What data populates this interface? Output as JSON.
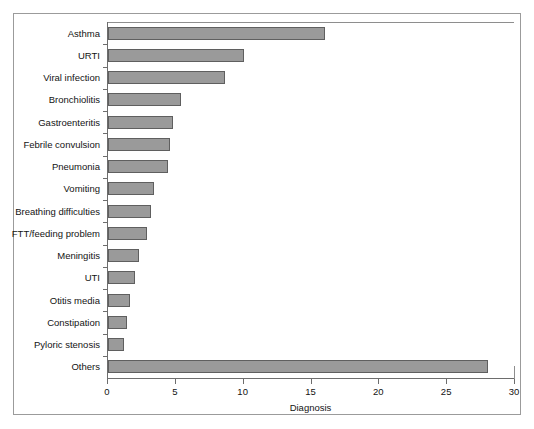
{
  "chart_data": {
    "type": "bar",
    "orientation": "horizontal",
    "title": "",
    "xlabel": "Diagnosis",
    "ylabel": "",
    "xlim": [
      0,
      30
    ],
    "xticks": [
      0,
      5,
      10,
      15,
      20,
      25,
      30
    ],
    "grid": false,
    "legend": null,
    "bar_color": "#9a9a9a",
    "bar_edge_color": "#5f5f5f",
    "categories": [
      "Asthma",
      "URTI",
      "Viral infection",
      "Bronchiolitis",
      "Gastroenteritis",
      "Febrile convulsion",
      "Pneumonia",
      "Vomiting",
      "Breathing difficulties",
      "FTT/feeding problem",
      "Meningitis",
      "UTI",
      "Otitis media",
      "Constipation",
      "Pyloric stenosis",
      "Others"
    ],
    "values": [
      16.0,
      10.0,
      8.6,
      5.4,
      4.8,
      4.6,
      4.4,
      3.4,
      3.2,
      2.9,
      2.3,
      2.0,
      1.6,
      1.4,
      1.2,
      28.0
    ]
  }
}
